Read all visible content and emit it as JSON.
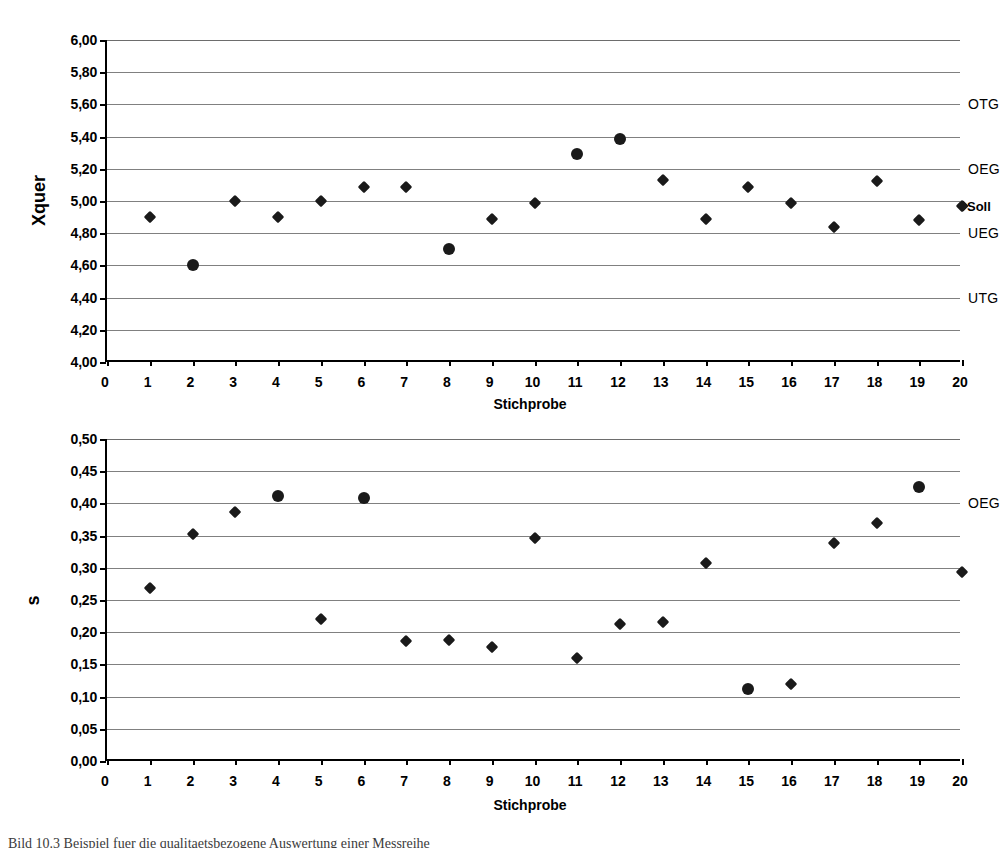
{
  "document": {
    "caption": "Bild 10.3    Beispiel fuer die qualitaetsbezogene Auswertung einer Messreihe"
  },
  "chart_data": [
    {
      "id": "xquer-chart",
      "type": "scatter",
      "title": "",
      "xlabel": "Stichprobe",
      "ylabel": "Xquer",
      "xlim": [
        0,
        20
      ],
      "ylim": [
        4.0,
        6.0
      ],
      "ytick_step": 0.2,
      "grid": true,
      "legend": "none",
      "xticks": [
        "0",
        "1",
        "2",
        "3",
        "4",
        "5",
        "6",
        "7",
        "8",
        "9",
        "10",
        "11",
        "12",
        "13",
        "14",
        "15",
        "16",
        "17",
        "18",
        "19",
        "20"
      ],
      "yticks": [
        "4,00",
        "4,20",
        "4,40",
        "4,60",
        "4,80",
        "5,00",
        "5,20",
        "5,40",
        "5,60",
        "5,80",
        "6,00"
      ],
      "ytick_values": [
        4.0,
        4.2,
        4.4,
        4.6,
        4.8,
        5.0,
        5.2,
        5.4,
        5.6,
        5.8,
        6.0
      ],
      "x": [
        1,
        2,
        3,
        4,
        5,
        6,
        7,
        8,
        9,
        10,
        11,
        12,
        13,
        14,
        15,
        16,
        17,
        18,
        19,
        20
      ],
      "values": [
        4.9,
        4.6,
        5.0,
        4.9,
        5.0,
        5.09,
        5.09,
        4.7,
        4.89,
        4.99,
        5.29,
        5.385,
        5.13,
        4.89,
        5.085,
        4.985,
        4.84,
        5.125,
        4.885,
        4.97
      ],
      "marker_shapes": [
        "diamond",
        "circle",
        "diamond",
        "diamond",
        "diamond",
        "diamond",
        "diamond",
        "circle",
        "diamond",
        "diamond",
        "circle",
        "circle",
        "diamond",
        "diamond",
        "diamond",
        "diamond",
        "diamond",
        "diamond",
        "diamond",
        "diamond"
      ],
      "limit_lines": [
        {
          "label": "OTG",
          "value": 5.6
        },
        {
          "label": "OEG",
          "value": 5.2
        },
        {
          "label": "Soll",
          "value": 4.97
        },
        {
          "label": "UEG",
          "value": 4.8
        },
        {
          "label": "UTG",
          "value": 4.4
        }
      ]
    },
    {
      "id": "s-chart",
      "type": "scatter",
      "title": "",
      "xlabel": "Stichprobe",
      "ylabel": "s",
      "xlim": [
        0,
        20
      ],
      "ylim": [
        0.0,
        0.5
      ],
      "ytick_step": 0.05,
      "grid": true,
      "legend": "none",
      "xticks": [
        "0",
        "1",
        "2",
        "3",
        "4",
        "5",
        "6",
        "7",
        "8",
        "9",
        "10",
        "11",
        "12",
        "13",
        "14",
        "15",
        "16",
        "17",
        "18",
        "19",
        "20"
      ],
      "yticks": [
        "0,00",
        "0,05",
        "0,10",
        "0,15",
        "0,20",
        "0,25",
        "0,30",
        "0,35",
        "0,40",
        "0,45",
        "0,50"
      ],
      "ytick_values": [
        0.0,
        0.05,
        0.1,
        0.15,
        0.2,
        0.25,
        0.3,
        0.35,
        0.4,
        0.45,
        0.5
      ],
      "x": [
        1,
        2,
        3,
        4,
        5,
        6,
        7,
        8,
        9,
        10,
        11,
        12,
        13,
        14,
        15,
        16,
        17,
        18,
        19,
        20
      ],
      "values": [
        0.268,
        0.353,
        0.387,
        0.411,
        0.22,
        0.408,
        0.186,
        0.188,
        0.177,
        0.346,
        0.16,
        0.213,
        0.216,
        0.307,
        0.112,
        0.12,
        0.339,
        0.369,
        0.425,
        0.294
      ],
      "marker_shapes": [
        "diamond",
        "diamond",
        "diamond",
        "circle",
        "diamond",
        "circle",
        "diamond",
        "diamond",
        "diamond",
        "diamond",
        "diamond",
        "diamond",
        "diamond",
        "diamond",
        "circle",
        "diamond",
        "diamond",
        "diamond",
        "circle",
        "diamond"
      ],
      "limit_lines": [
        {
          "label": "OEG",
          "value": 0.4
        }
      ]
    }
  ]
}
